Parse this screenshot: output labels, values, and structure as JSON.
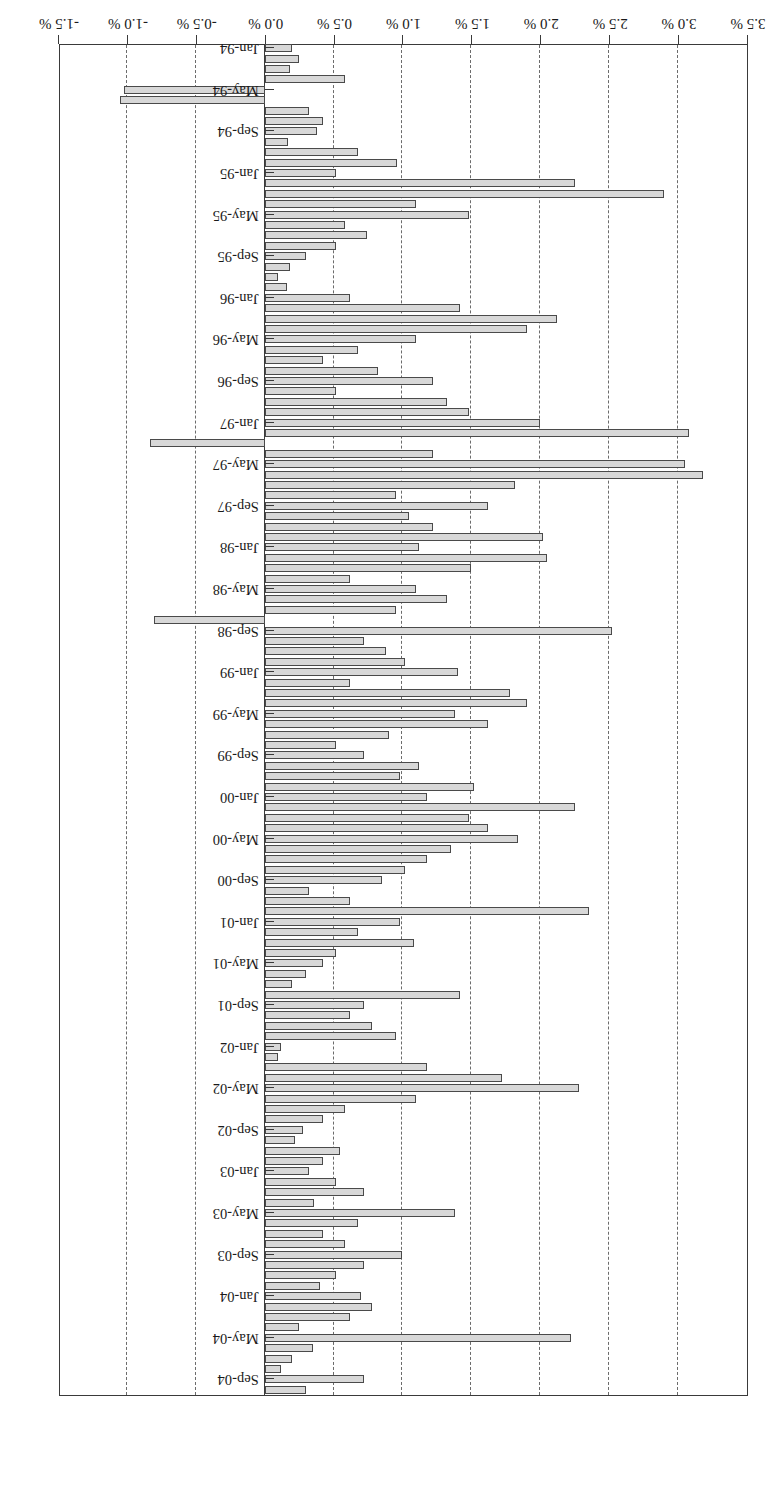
{
  "chart_data": {
    "type": "bar",
    "orientation": "vertical-rotated-180",
    "title": "CS/Tremont Equity Market Neutral",
    "subtitle": "",
    "xlabel": "",
    "ylabel": "",
    "ylim": [
      -1.5,
      3.5
    ],
    "grid": true,
    "grid_axis": "value",
    "legend": false,
    "legend_position": "none",
    "value_axis_ticks": [
      3.5,
      3.0,
      2.5,
      2.0,
      1.5,
      1.0,
      0.5,
      0.0,
      -0.5,
      -1.0,
      -1.5
    ],
    "value_axis_tick_labels": [
      "3.5 %",
      "3.0 %",
      "2.5 %",
      "2.0 %",
      "1.5 %",
      "1.0 %",
      "0.5 %",
      "0.0 %",
      "-0.5 %",
      "-1.0 %",
      "-1.5 %"
    ],
    "category_tick_labels": [
      "Jan-94",
      "May-94",
      "Sep-94",
      "Jan-95",
      "May-95",
      "Sep-95",
      "Jan-96",
      "May-96",
      "Sep-96",
      "Jan-97",
      "May-97",
      "Sep-97",
      "Jan-98",
      "May-98",
      "Sep-98",
      "Jan-99",
      "May-99",
      "Sep-99",
      "Jan-00",
      "May-00",
      "Sep-00",
      "Jan-01",
      "May-01",
      "Sep-01",
      "Jan-02",
      "May-02",
      "Sep-02",
      "Jan-03",
      "May-03",
      "Sep-03",
      "Jan-04",
      "May-04",
      "Sep-04"
    ],
    "category_tick_every": 4,
    "bar_fill_color": "#d8d8d8",
    "bar_edge_color": "#4a4a4a",
    "grid_color": "#6b6b6b",
    "axis_color": "#3a3a3a",
    "categories": [
      "Jan-94",
      "Feb-94",
      "Mar-94",
      "Apr-94",
      "May-94",
      "Jun-94",
      "Jul-94",
      "Aug-94",
      "Sep-94",
      "Oct-94",
      "Nov-94",
      "Dec-94",
      "Jan-95",
      "Feb-95",
      "Mar-95",
      "Apr-95",
      "May-95",
      "Jun-95",
      "Jul-95",
      "Aug-95",
      "Sep-95",
      "Oct-95",
      "Nov-95",
      "Dec-95",
      "Jan-96",
      "Feb-96",
      "Mar-96",
      "Apr-96",
      "May-96",
      "Jun-96",
      "Jul-96",
      "Aug-96",
      "Sep-96",
      "Oct-96",
      "Nov-96",
      "Dec-96",
      "Jan-97",
      "Feb-97",
      "Mar-97",
      "Apr-97",
      "May-97",
      "Jun-97",
      "Jul-97",
      "Aug-97",
      "Sep-97",
      "Oct-97",
      "Nov-97",
      "Dec-97",
      "Jan-98",
      "Feb-98",
      "Mar-98",
      "Apr-98",
      "May-98",
      "Jun-98",
      "Jul-98",
      "Aug-98",
      "Sep-98",
      "Oct-98",
      "Nov-98",
      "Dec-98",
      "Jan-99",
      "Feb-99",
      "Mar-99",
      "Apr-99",
      "May-99",
      "Jun-99",
      "Jul-99",
      "Aug-99",
      "Sep-99",
      "Oct-99",
      "Nov-99",
      "Dec-99",
      "Jan-00",
      "Feb-00",
      "Mar-00",
      "Apr-00",
      "May-00",
      "Jun-00",
      "Jul-00",
      "Aug-00",
      "Sep-00",
      "Oct-00",
      "Nov-00",
      "Dec-00",
      "Jan-01",
      "Feb-01",
      "Mar-01",
      "Apr-01",
      "May-01",
      "Jun-01",
      "Jul-01",
      "Aug-01",
      "Sep-01",
      "Oct-01",
      "Nov-01",
      "Dec-01",
      "Jan-02",
      "Feb-02",
      "Mar-02",
      "Apr-02",
      "May-02",
      "Jun-02",
      "Jul-02",
      "Aug-02",
      "Sep-02",
      "Oct-02",
      "Nov-02",
      "Dec-02",
      "Jan-03",
      "Feb-03",
      "Mar-03",
      "Apr-03",
      "May-03",
      "Jun-03",
      "Jul-03",
      "Aug-03",
      "Sep-03",
      "Oct-03",
      "Nov-03",
      "Dec-03",
      "Jan-04",
      "Feb-04",
      "Mar-04",
      "Apr-04",
      "May-04",
      "Jun-04",
      "Jul-04",
      "Aug-04",
      "Sep-04",
      "Oct-04"
    ],
    "values": [
      0.2,
      0.25,
      0.18,
      0.58,
      -1.02,
      -1.05,
      0.32,
      0.42,
      0.38,
      0.17,
      0.68,
      0.96,
      0.52,
      2.25,
      2.9,
      1.1,
      1.48,
      0.58,
      0.74,
      0.52,
      0.3,
      0.18,
      0.1,
      0.16,
      0.62,
      1.42,
      2.12,
      1.9,
      1.1,
      0.68,
      0.42,
      0.82,
      1.22,
      0.52,
      1.32,
      1.48,
      2.0,
      3.08,
      -0.83,
      1.22,
      3.05,
      3.18,
      1.82,
      0.95,
      1.62,
      1.05,
      1.22,
      2.02,
      1.12,
      2.05,
      1.5,
      0.62,
      1.1,
      1.32,
      0.95,
      -0.8,
      2.52,
      0.72,
      0.88,
      1.02,
      1.4,
      0.62,
      1.78,
      1.9,
      1.38,
      1.62,
      0.9,
      0.52,
      0.72,
      1.12,
      0.98,
      1.52,
      1.18,
      2.25,
      1.48,
      1.62,
      1.84,
      1.35,
      1.18,
      1.02,
      0.85,
      0.32,
      0.62,
      2.35,
      0.98,
      0.68,
      1.08,
      0.52,
      0.42,
      0.3,
      0.2,
      1.42,
      0.72,
      0.62,
      0.78,
      0.95,
      0.12,
      0.1,
      1.18,
      1.72,
      2.28,
      1.1,
      0.58,
      0.42,
      0.28,
      0.22,
      0.55,
      0.42,
      0.32,
      0.52,
      0.72,
      0.36,
      1.38,
      0.68,
      0.42,
      0.58,
      1.0,
      0.72,
      0.52,
      0.4,
      0.7,
      0.78,
      0.62,
      0.25,
      2.22,
      0.35,
      0.2,
      0.12,
      0.72,
      0.3
    ]
  }
}
